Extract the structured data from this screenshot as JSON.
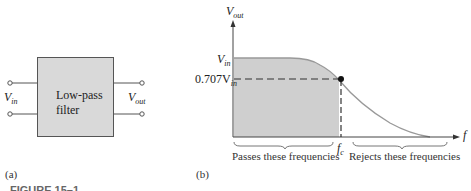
{
  "panel_a": {
    "label": "(a)",
    "block": {
      "line1": "Low-pass",
      "line2": "filter"
    },
    "input_label": "V",
    "input_sub": "in",
    "output_label": "V",
    "output_sub": "out"
  },
  "panel_b": {
    "label": "(b)",
    "y_axis_label": "V",
    "y_axis_sub": "out",
    "x_axis_label": "f",
    "vin_tick": "V",
    "vin_tick_sub": "in",
    "level_tick": "0.707V",
    "level_tick_sub": "in",
    "fc_label": "f",
    "fc_sub": "c",
    "pass_region": "Passes these frequencies",
    "reject_region": "Rejects these frequencies"
  },
  "figure_caption": "FIGURE 15–1",
  "colors": {
    "shade": "#cfcfcf",
    "curve": "#999999",
    "box": "#d9d9d9"
  }
}
